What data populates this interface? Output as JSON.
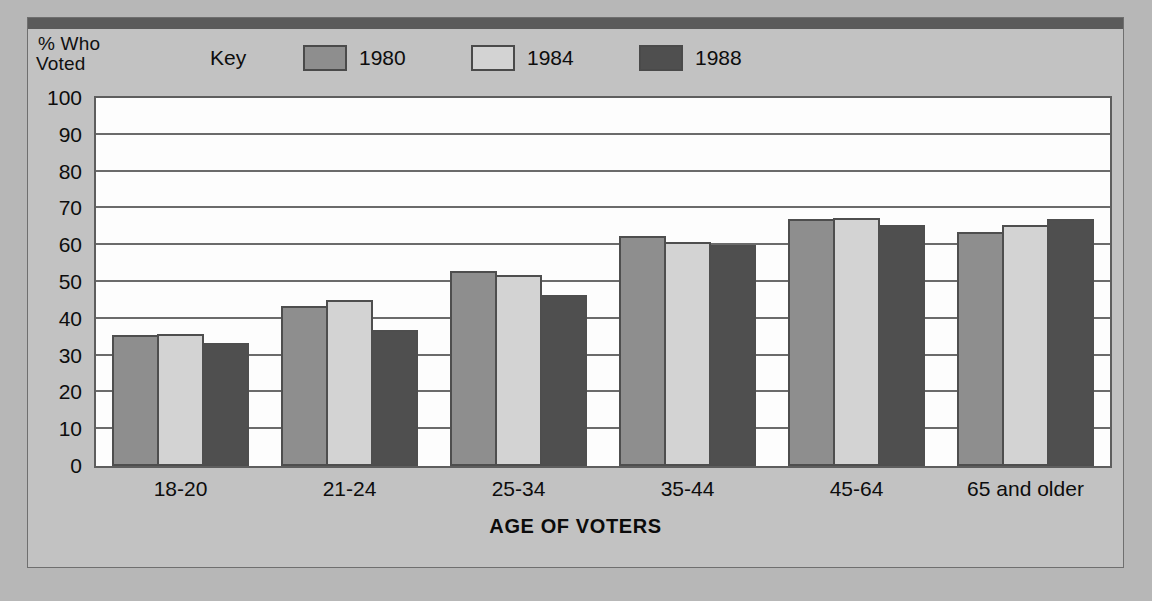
{
  "legend": {
    "key_label": "Key",
    "entries": [
      {
        "label": "1980",
        "color": "#8e8e8e"
      },
      {
        "label": "1984",
        "color": "#d3d3d3"
      },
      {
        "label": "1988",
        "color": "#4f4f4f"
      }
    ]
  },
  "axes": {
    "y_title_line1": "% Who",
    "y_title_line2": "Voted",
    "x_title": "AGE OF VOTERS"
  },
  "colors": {
    "page_background": "#b7b7b7",
    "card_background": "#c2c2c2",
    "top_bar": "#5b5b5b",
    "plot_background": "#fdfdfd",
    "gridline": "#6b6b6b",
    "bar_outline": "#4e4e4e",
    "text": "#0d0d0d"
  },
  "chart_data": {
    "type": "bar",
    "title": "",
    "subtitle": "",
    "xlabel": "AGE OF VOTERS",
    "ylabel": "% Who Voted",
    "ylim": [
      0,
      100
    ],
    "y_ticks": [
      0,
      10,
      20,
      30,
      40,
      50,
      60,
      70,
      80,
      90,
      100
    ],
    "grid": true,
    "legend_position": "top",
    "categories": [
      "18-20",
      "21-24",
      "25-34",
      "35-44",
      "45-64",
      "65 and older"
    ],
    "series": [
      {
        "name": "1980",
        "color": "#8e8e8e",
        "values": [
          35.5,
          43.5,
          53,
          62.5,
          67,
          63.5
        ]
      },
      {
        "name": "1984",
        "color": "#d3d3d3",
        "values": [
          36,
          45,
          52,
          61,
          67.5,
          65.5
        ]
      },
      {
        "name": "1988",
        "color": "#4f4f4f",
        "values": [
          33.5,
          37,
          46.5,
          60,
          65.5,
          67
        ]
      }
    ]
  }
}
